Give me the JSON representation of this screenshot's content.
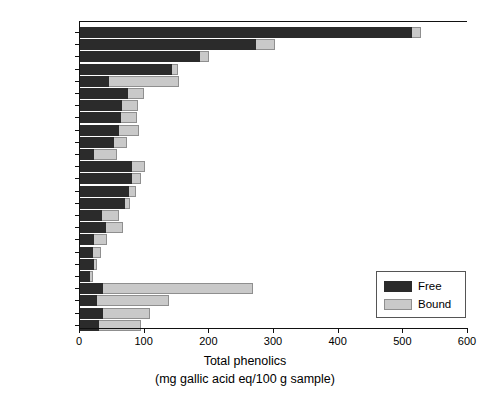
{
  "chart_data": {
    "type": "bar",
    "orientation": "horizontal",
    "stacked": true,
    "title": "",
    "xlabel": "Total phenolics",
    "xlabel_line2": "(mg gallic acid eq/100 g sample)",
    "ylabel": "",
    "xlim": [
      0,
      600
    ],
    "xticks": [
      0,
      100,
      200,
      300,
      400,
      500,
      600
    ],
    "grid": false,
    "legend_position": "lower-right",
    "categories": [
      "Cranberry",
      "Apple",
      "Red grape",
      "Strawberry",
      "Pineapple",
      "Banana",
      "Peach",
      "Lemon",
      "Orange",
      "Pear",
      "Grapefruit",
      "Broccoli",
      "Spinach",
      "Onion",
      "Red Pepper",
      "Carrot",
      "Cabbage",
      "Potato",
      "Lettuce",
      "Celery",
      "Cucumber",
      "Corn",
      "Wheat",
      "Oats",
      "Rice"
    ],
    "series": [
      {
        "name": "Free",
        "color": "#2b2b2b",
        "values": [
          513,
          272,
          185,
          143,
          45,
          74,
          65,
          63,
          60,
          53,
          21,
          81,
          80,
          76,
          70,
          34,
          40,
          22,
          20,
          22,
          15,
          36,
          27,
          35,
          29
        ]
      },
      {
        "name": "Bound",
        "color": "#c9c9c9",
        "values": [
          14,
          30,
          15,
          9,
          108,
          25,
          25,
          25,
          32,
          20,
          36,
          19,
          15,
          10,
          7,
          27,
          26,
          20,
          12,
          4,
          5,
          232,
          110,
          73,
          66
        ]
      }
    ]
  },
  "legend": {
    "entries": [
      {
        "label": "Free",
        "swatch": "free-swatch"
      },
      {
        "label": "Bound",
        "swatch": "bound-swatch"
      }
    ]
  },
  "axis": {
    "x_tick_labels": [
      "0",
      "100",
      "200",
      "300",
      "400",
      "500",
      "600"
    ],
    "x_title_line1": "Total phenolics",
    "x_title_line2": "(mg gallic acid eq/100 g sample)"
  }
}
